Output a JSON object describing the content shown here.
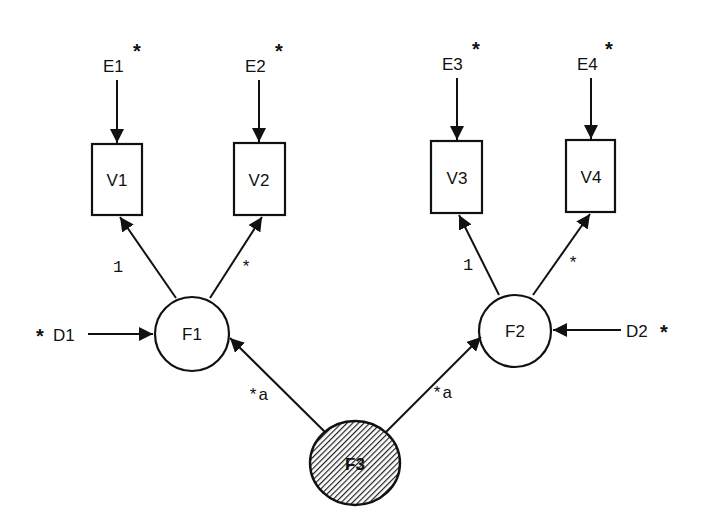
{
  "diagram": {
    "type": "structural-equation-model path diagram",
    "colors": {
      "line": "#111111",
      "background": "#ffffff",
      "latent_fill_hatch": "#555555"
    },
    "errors": [
      {
        "id": "E1",
        "label": "E1",
        "free_marker": "*",
        "target": "V1"
      },
      {
        "id": "E2",
        "label": "E2",
        "free_marker": "*",
        "target": "V2"
      },
      {
        "id": "E3",
        "label": "E3",
        "free_marker": "*",
        "target": "V3"
      },
      {
        "id": "E4",
        "label": "E4",
        "free_marker": "*",
        "target": "V4"
      }
    ],
    "observed": [
      {
        "id": "V1",
        "label": "V1"
      },
      {
        "id": "V2",
        "label": "V2"
      },
      {
        "id": "V3",
        "label": "V3"
      },
      {
        "id": "V4",
        "label": "V4"
      }
    ],
    "factors": [
      {
        "id": "F1",
        "label": "F1"
      },
      {
        "id": "F2",
        "label": "F2"
      },
      {
        "id": "F3",
        "label": "F3",
        "shaded": true
      }
    ],
    "disturbances": [
      {
        "id": "D1",
        "label": "D1",
        "free_marker": "*",
        "target": "F1"
      },
      {
        "id": "D2",
        "label": "D2",
        "free_marker": "*",
        "target": "F2"
      }
    ],
    "paths": [
      {
        "from": "F1",
        "to": "V1",
        "label": "1"
      },
      {
        "from": "F1",
        "to": "V2",
        "label": "*"
      },
      {
        "from": "F2",
        "to": "V3",
        "label": "1"
      },
      {
        "from": "F2",
        "to": "V4",
        "label": "*"
      },
      {
        "from": "F3",
        "to": "F1",
        "label": "*a"
      },
      {
        "from": "F3",
        "to": "F2",
        "label": "*a"
      }
    ]
  }
}
